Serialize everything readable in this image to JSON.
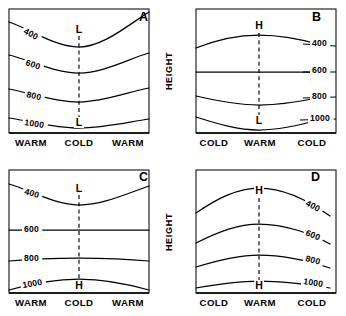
{
  "figure": {
    "axis_y_label": "HEIGHT",
    "panels": [
      {
        "id": "A",
        "letter": "A",
        "letter_x": 139,
        "letter_y": 21,
        "frame": {
          "x": 9,
          "y": 9,
          "w": 140,
          "h": 124
        },
        "center_x": 79,
        "marker_top": {
          "text": "L",
          "x": 79,
          "y": 33
        },
        "marker_bottom": {
          "text": "L",
          "x": 79,
          "y": 126
        },
        "dash": {
          "x": 79,
          "y1": 36,
          "y2": 120
        },
        "label_side": "left",
        "axis_labels": [
          {
            "text": "WARM",
            "x": 31,
            "y": 146
          },
          {
            "text": "COLD",
            "x": 79,
            "y": 146
          },
          {
            "text": "WARM",
            "x": 128,
            "y": 146
          }
        ],
        "contours": [
          {
            "value": "400",
            "d": "M 9 22 C 30 29, 55 47, 79 47 C 103 47, 128 25, 149 12",
            "label_x": 23,
            "label_y": 33,
            "label_rot": 28
          },
          {
            "value": "600",
            "d": "M 9 55 C 30 60, 55 73, 79 73 C 103 73, 128 59, 149 53",
            "label_x": 25,
            "label_y": 65,
            "label_rot": 19
          },
          {
            "value": "800",
            "d": "M 9 89 C 30 93, 55 102, 79 102 C 103 102, 128 92, 149 88",
            "label_x": 26,
            "label_y": 97,
            "label_rot": 13
          },
          {
            "value": "1000",
            "d": "M 9 118 C 30 121, 55 128, 79 128 C 103 128, 128 122, 149 119",
            "label_x": 24,
            "label_y": 125,
            "label_rot": 9
          }
        ]
      },
      {
        "id": "B",
        "letter": "B",
        "letter_x": 312,
        "letter_y": 21,
        "frame": {
          "x": 196,
          "y": 9,
          "w": 140,
          "h": 124
        },
        "center_x": 259,
        "marker_top": {
          "text": "H",
          "x": 259,
          "y": 29
        },
        "marker_bottom": {
          "text": "L",
          "x": 259,
          "y": 124
        },
        "dash": {
          "x": 259,
          "y1": 33,
          "y2": 116
        },
        "label_side": "right",
        "axis_labels": [
          {
            "text": "COLD",
            "x": 214,
            "y": 146
          },
          {
            "text": "WARM",
            "x": 260,
            "y": 146
          },
          {
            "text": "COLD",
            "x": 312,
            "y": 146
          }
        ],
        "contours": [
          {
            "value": "400",
            "d": "M 196 48 C 218 39, 238 35, 259 35 C 283 35, 308 41, 322 45",
            "label_x": 312,
            "label_y": 46,
            "label_rot": 0,
            "stub": {
              "x1": 303,
              "y1": 44,
              "x2": 336,
              "y2": 46
            }
          },
          {
            "value": "600",
            "d": "M 196 72 C 218 72, 238 72, 259 72 C 283 72, 308 72, 322 72",
            "label_x": 312,
            "label_y": 73,
            "label_rot": 0,
            "stub": {
              "x1": 303,
              "y1": 72,
              "x2": 336,
              "y2": 72
            }
          },
          {
            "value": "800",
            "d": "M 196 96 C 218 101, 238 105, 259 105 C 283 105, 308 100, 322 97",
            "label_x": 312,
            "label_y": 99,
            "label_rot": 0,
            "stub": {
              "x1": 303,
              "y1": 98,
              "x2": 336,
              "y2": 97
            }
          },
          {
            "value": "1000",
            "d": "M 196 117 C 218 124, 238 130, 259 130 C 283 130, 308 123, 322 119",
            "label_x": 310,
            "label_y": 121,
            "label_rot": 0,
            "stub": {
              "x1": 300,
              "y1": 120,
              "x2": 336,
              "y2": 119
            }
          }
        ]
      },
      {
        "id": "C",
        "letter": "C",
        "letter_x": 139,
        "letter_y": 181,
        "frame": {
          "x": 9,
          "y": 170,
          "w": 140,
          "h": 123
        },
        "center_x": 79,
        "marker_top": {
          "text": "L",
          "x": 79,
          "y": 192
        },
        "marker_bottom": {
          "text": "H",
          "x": 79,
          "y": 289
        },
        "dash": {
          "x": 79,
          "y1": 195,
          "y2": 281
        },
        "label_side": "left",
        "axis_labels": [
          {
            "text": "WARM",
            "x": 31,
            "y": 306
          },
          {
            "text": "COLD",
            "x": 79,
            "y": 306
          },
          {
            "text": "WARM",
            "x": 128,
            "y": 306
          }
        ],
        "contours": [
          {
            "value": "400",
            "d": "M 9 184 C 30 190, 55 205, 79 205 C 103 205, 128 193, 149 186",
            "label_x": 24,
            "label_y": 194,
            "label_rot": 16
          },
          {
            "value": "600",
            "d": "M 9 230 C 30 230, 55 230, 79 230 C 103 230, 128 230, 149 230",
            "label_x": 24,
            "label_y": 232,
            "label_rot": 0
          },
          {
            "value": "800",
            "d": "M 9 261 C 30 259, 55 258, 79 258 C 103 258, 128 259, 149 261",
            "label_x": 24,
            "label_y": 261,
            "label_rot": 0
          },
          {
            "value": "1000",
            "d": "M 9 290 C 30 284, 55 279, 79 279 C 103 279, 128 284, 149 290",
            "label_x": 23,
            "label_y": 288,
            "label_rot": -10
          }
        ]
      },
      {
        "id": "D",
        "letter": "D",
        "letter_x": 311,
        "letter_y": 181,
        "frame": {
          "x": 196,
          "y": 170,
          "w": 140,
          "h": 123
        },
        "center_x": 259,
        "marker_top": {
          "text": "H",
          "x": 259,
          "y": 194
        },
        "marker_bottom": {
          "text": "H",
          "x": 259,
          "y": 289
        },
        "dash": {
          "x": 259,
          "y1": 198,
          "y2": 281
        },
        "label_side": "right",
        "axis_labels": [
          {
            "text": "COLD",
            "x": 214,
            "y": 306
          },
          {
            "text": "WARM",
            "x": 260,
            "y": 306
          },
          {
            "text": "COLD",
            "x": 312,
            "y": 306
          }
        ],
        "contours": [
          {
            "value": "400",
            "d": "M 196 213 C 218 198, 238 188, 259 188 C 285 188, 312 203, 330 216",
            "label_x": 305,
            "label_y": 205,
            "label_rot": 28
          },
          {
            "value": "600",
            "d": "M 196 243 C 218 232, 238 224, 259 224 C 285 224, 312 234, 330 244",
            "label_x": 305,
            "label_y": 235,
            "label_rot": 22
          },
          {
            "value": "800",
            "d": "M 196 267 C 218 260, 238 255, 259 255 C 285 255, 312 262, 330 268",
            "label_x": 305,
            "label_y": 261,
            "label_rot": 14
          },
          {
            "value": "1000",
            "d": "M 196 288 C 218 284, 238 281, 259 281 C 285 281, 312 285, 330 288",
            "label_x": 303,
            "label_y": 284,
            "label_rot": 9
          }
        ]
      }
    ],
    "height_labels": [
      {
        "x": 172,
        "y": 71
      },
      {
        "x": 172,
        "y": 232
      }
    ]
  }
}
